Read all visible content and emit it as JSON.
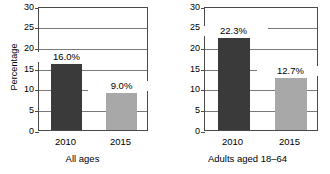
{
  "chart_data": {
    "type": "bar",
    "title": "",
    "subtitle": "",
    "xlabel": "",
    "ylabel": "Percentage",
    "ylim": [
      0,
      30
    ],
    "ytick_values": [
      0,
      5,
      10,
      15,
      20,
      25,
      30
    ],
    "ytick_labels": [
      "0",
      "5",
      "10",
      "15",
      "20",
      "25",
      "30"
    ],
    "grid": true,
    "legend": false,
    "legend_position": "none",
    "categories": [
      "2010",
      "2015"
    ],
    "panels": [
      {
        "caption": "All ages",
        "show_ylabel": true,
        "bars": [
          {
            "category": "2010",
            "value": 16.0,
            "label": "16.0%",
            "color": "#3a3a3a"
          },
          {
            "category": "2015",
            "value": 9.0,
            "label": "9.0%",
            "color": "#a8a8a8"
          }
        ]
      },
      {
        "caption": "Adults aged 18–64",
        "show_ylabel": false,
        "bars": [
          {
            "category": "2010",
            "value": 22.3,
            "label": "22.3%",
            "color": "#3a3a3a"
          },
          {
            "category": "2015",
            "value": 12.7,
            "label": "12.7%",
            "color": "#a8a8a8"
          }
        ]
      }
    ],
    "series": [
      {
        "name": "2010",
        "values": [
          16.0,
          22.3
        ],
        "color": "#3a3a3a"
      },
      {
        "name": "2015",
        "values": [
          9.0,
          12.7
        ],
        "color": "#a8a8a8"
      }
    ],
    "colors": {
      "bar_2010": "#3a3a3a",
      "bar_2015": "#a8a8a8",
      "axis": "#4a4a4a",
      "gridline": "#7a7a7a",
      "background": "#ffffff",
      "text": "#000000"
    }
  }
}
